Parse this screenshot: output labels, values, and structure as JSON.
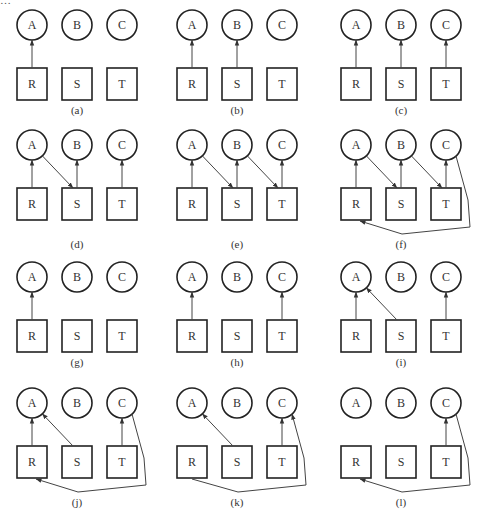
{
  "header": {
    "caption_cut_off": "…"
  },
  "colors": {
    "stroke": "#222222",
    "edge": "#444444",
    "background": "#ffffff"
  },
  "nodes": {
    "circles": [
      "A",
      "B",
      "C"
    ],
    "boxes": [
      "R",
      "S",
      "T"
    ]
  },
  "panels": [
    {
      "id": "a",
      "label": "(a)",
      "edges": [
        {
          "from": "R",
          "to": "A"
        }
      ]
    },
    {
      "id": "b",
      "label": "(b)",
      "edges": [
        {
          "from": "R",
          "to": "A"
        },
        {
          "from": "S",
          "to": "B"
        }
      ]
    },
    {
      "id": "c",
      "label": "(c)",
      "edges": [
        {
          "from": "R",
          "to": "A"
        },
        {
          "from": "S",
          "to": "B"
        },
        {
          "from": "T",
          "to": "C"
        }
      ]
    },
    {
      "id": "d",
      "label": "(d)",
      "edges": [
        {
          "from": "R",
          "to": "A"
        },
        {
          "from": "A",
          "to": "S"
        },
        {
          "from": "S",
          "to": "B"
        },
        {
          "from": "T",
          "to": "C"
        }
      ]
    },
    {
      "id": "e",
      "label": "(e)",
      "edges": [
        {
          "from": "R",
          "to": "A"
        },
        {
          "from": "A",
          "to": "S"
        },
        {
          "from": "S",
          "to": "B"
        },
        {
          "from": "B",
          "to": "T"
        },
        {
          "from": "T",
          "to": "C"
        }
      ]
    },
    {
      "id": "f",
      "label": "(f)",
      "edges": [
        {
          "from": "R",
          "to": "A"
        },
        {
          "from": "A",
          "to": "S"
        },
        {
          "from": "S",
          "to": "B"
        },
        {
          "from": "B",
          "to": "T"
        },
        {
          "from": "T",
          "to": "C"
        },
        {
          "from": "C",
          "to": "R",
          "route": "around"
        }
      ]
    },
    {
      "id": "g",
      "label": "(g)",
      "edges": [
        {
          "from": "R",
          "to": "A"
        }
      ]
    },
    {
      "id": "h",
      "label": "(h)",
      "edges": [
        {
          "from": "R",
          "to": "A"
        },
        {
          "from": "T",
          "to": "C"
        }
      ]
    },
    {
      "id": "i",
      "label": "(i)",
      "edges": [
        {
          "from": "R",
          "to": "A"
        },
        {
          "from": "S",
          "to": "A"
        },
        {
          "from": "T",
          "to": "C"
        }
      ]
    },
    {
      "id": "j",
      "label": "(j)",
      "edges": [
        {
          "from": "R",
          "to": "A"
        },
        {
          "from": "S",
          "to": "A"
        },
        {
          "from": "T",
          "to": "C"
        },
        {
          "from": "C",
          "to": "R",
          "route": "around"
        }
      ]
    },
    {
      "id": "k",
      "label": "(k)",
      "edges": [
        {
          "from": "S",
          "to": "A"
        },
        {
          "from": "T",
          "to": "C"
        },
        {
          "from": "R",
          "to": "C",
          "route": "around"
        }
      ]
    },
    {
      "id": "l",
      "label": "(l)",
      "edges": [
        {
          "from": "T",
          "to": "C"
        },
        {
          "from": "C",
          "to": "R",
          "route": "around"
        }
      ]
    }
  ]
}
